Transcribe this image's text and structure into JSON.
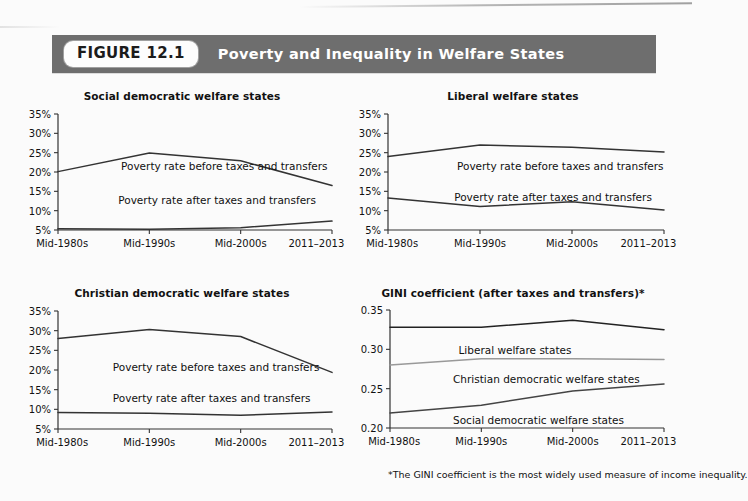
{
  "figure": {
    "badge": "FIGURE 12.1",
    "title": "Poverty and Inequality in Welfare States",
    "band_color": "#6e6e6e",
    "badge_bg": "#fdfdfd"
  },
  "footnote": "*The GINI coefficient is the most widely used measure of income inequality.",
  "categories": [
    "Mid-1980s",
    "Mid-1990s",
    "Mid-2000s",
    "2011–2013"
  ],
  "chart_data": [
    {
      "id": "social-democratic",
      "type": "line",
      "title": "Social democratic welfare states",
      "xlabel": "",
      "ylabel": "",
      "ylim": [
        5,
        35
      ],
      "yticks": [
        5,
        10,
        15,
        20,
        25,
        30,
        35
      ],
      "ytick_labels": [
        "5%",
        "10%",
        "15%",
        "20%",
        "25%",
        "30%",
        "35%"
      ],
      "grid": false,
      "legend": "inline-annotations",
      "categories": [
        "Mid-1980s",
        "Mid-1990s",
        "Mid-2000s",
        "2011–2013"
      ],
      "series": [
        {
          "name": "Poverty rate before taxes and transfers",
          "values": [
            20.1,
            24.9,
            22.9,
            16.5
          ],
          "color": "#333333"
        },
        {
          "name": "Poverty rate after taxes and transfers",
          "values": [
            5.3,
            5.2,
            5.6,
            7.3
          ],
          "color": "#333333"
        }
      ]
    },
    {
      "id": "liberal",
      "type": "line",
      "title": "Liberal welfare states",
      "xlabel": "",
      "ylabel": "",
      "ylim": [
        5,
        35
      ],
      "yticks": [
        5,
        10,
        15,
        20,
        25,
        30,
        35
      ],
      "ytick_labels": [
        "5%",
        "10%",
        "15%",
        "20%",
        "25%",
        "30%",
        "35%"
      ],
      "grid": false,
      "legend": "inline-annotations",
      "categories": [
        "Mid-1980s",
        "Mid-1990s",
        "Mid-2000s",
        "2011–2013"
      ],
      "series": [
        {
          "name": "Poverty rate before taxes and transfers",
          "values": [
            24.0,
            27.0,
            26.4,
            25.2
          ],
          "color": "#333333"
        },
        {
          "name": "Poverty rate after taxes and transfers",
          "values": [
            13.3,
            11.1,
            12.3,
            10.2
          ],
          "color": "#333333"
        }
      ]
    },
    {
      "id": "christian-democratic",
      "type": "line",
      "title": "Christian democratic welfare states",
      "xlabel": "",
      "ylabel": "",
      "ylim": [
        5,
        35
      ],
      "yticks": [
        5,
        10,
        15,
        20,
        25,
        30,
        35
      ],
      "ytick_labels": [
        "5%",
        "10%",
        "15%",
        "20%",
        "25%",
        "30%",
        "35%"
      ],
      "grid": false,
      "legend": "inline-annotations",
      "categories": [
        "Mid-1980s",
        "Mid-1990s",
        "Mid-2000s",
        "2011–2013"
      ],
      "series": [
        {
          "name": "Poverty rate before taxes and transfers",
          "values": [
            28.0,
            30.3,
            28.5,
            19.4
          ],
          "color": "#333333"
        },
        {
          "name": "Poverty rate after taxes and transfers",
          "values": [
            9.2,
            9.0,
            8.5,
            9.3
          ],
          "color": "#333333"
        }
      ]
    },
    {
      "id": "gini",
      "type": "line",
      "title": "GINI coefficient (after taxes and transfers)*",
      "xlabel": "",
      "ylabel": "",
      "ylim": [
        0.2,
        0.35
      ],
      "yticks": [
        0.2,
        0.25,
        0.3,
        0.35
      ],
      "ytick_labels": [
        "0.20",
        "0.25",
        "0.30",
        "0.35"
      ],
      "grid": false,
      "legend": "inline-annotations",
      "categories": [
        "Mid-1980s",
        "Mid-1990s",
        "Mid-2000s",
        "2011–2013"
      ],
      "series": [
        {
          "name": "Liberal welfare states",
          "values": [
            0.328,
            0.328,
            0.337,
            0.325
          ],
          "color": "#222222"
        },
        {
          "name": "Christian democratic welfare states",
          "values": [
            0.28,
            0.288,
            0.288,
            0.287
          ],
          "color": "#999999"
        },
        {
          "name": "Social democratic welfare states",
          "values": [
            0.219,
            0.229,
            0.247,
            0.256
          ],
          "color": "#444444"
        }
      ]
    }
  ]
}
